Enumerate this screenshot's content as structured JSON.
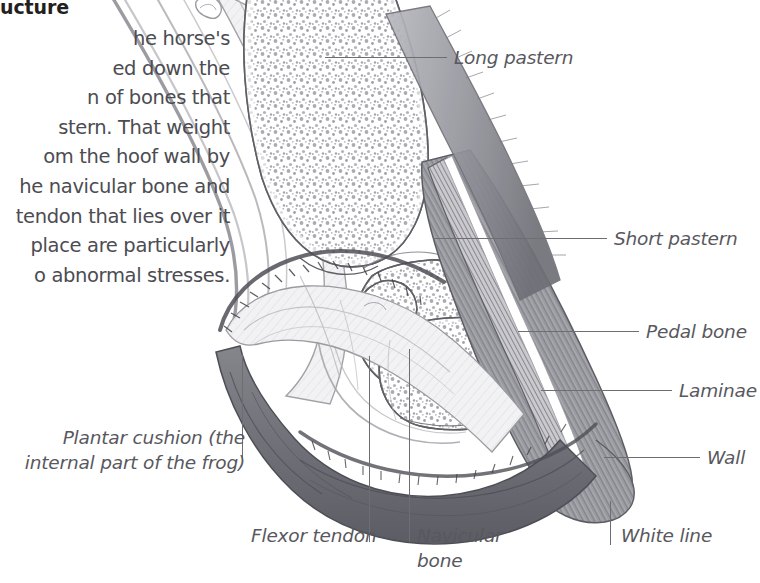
{
  "page": {
    "background_color": "#ffffff",
    "width": 760,
    "height": 583
  },
  "article": {
    "heading": "ucture",
    "body_lines": [
      "he horse's",
      "ed down the",
      "n of bones that",
      "stern. That weight",
      "om the hoof wall by",
      "he navicular bone and",
      " tendon that lies over it",
      " place are particularly",
      "o abnormal stresses."
    ],
    "text_color": "#4c4c52",
    "heading_color": "#231f20"
  },
  "illustration": {
    "title": "sagittal-section-of-horse-hoof",
    "description": "Pencil-shaded anatomical cross-section of a horse's lower limb and hoof showing the long pastern, short pastern and pedal bone with stippled cancellous bone texture, the navicular bone, flexor tendon, laminae, hoof wall, white line and plantar cushion.",
    "line_color": "#6d6d73",
    "bone_outline_color": "#5a5a60",
    "hoof_wall_color": "#8d8d92",
    "sole_color": "#6a6a70",
    "stipple_color": "#9a9aa0"
  },
  "labels": [
    {
      "id": "long-pastern",
      "text": "Long pastern",
      "leader": "horizontal"
    },
    {
      "id": "short-pastern",
      "text": "Short pastern",
      "leader": "horizontal"
    },
    {
      "id": "pedal-bone",
      "text": "Pedal bone",
      "leader": "horizontal"
    },
    {
      "id": "laminae",
      "text": "Laminae",
      "leader": "horizontal"
    },
    {
      "id": "wall",
      "text": "Wall",
      "leader": "horizontal"
    },
    {
      "id": "white-line",
      "text": "White line",
      "leader": "vertical"
    },
    {
      "id": "flexor-tendon",
      "text": "Flexor tendon",
      "leader": "vertical"
    },
    {
      "id": "navicular",
      "text": "Navicular bone",
      "leader": "vertical"
    },
    {
      "id": "plantar-cushion",
      "text": "Plantar cushion (the internal part of the frog)",
      "leader": "vertical"
    }
  ],
  "label_text": {
    "long_pastern": "Long pastern",
    "short_pastern": "Short pastern",
    "pedal_bone": "Pedal bone",
    "laminae": "Laminae",
    "wall": "Wall",
    "white_line": "White line",
    "flexor_tendon": "Flexor tendon",
    "navicular_bone": "Navicular bone",
    "plantar_cushion": "Plantar cushion (the internal part of the frog)"
  }
}
